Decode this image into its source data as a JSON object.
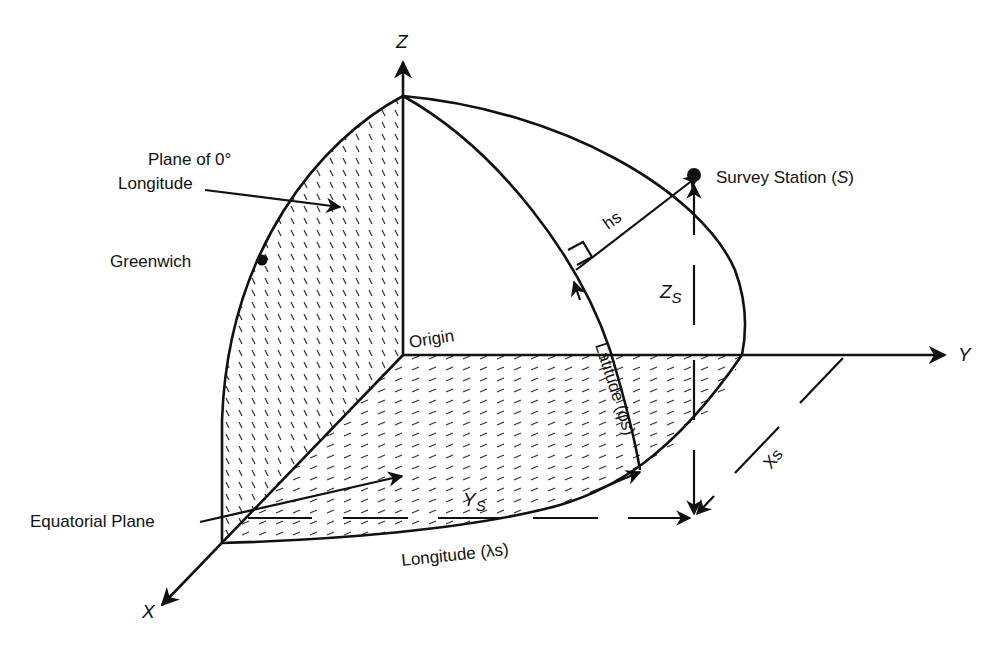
{
  "diagram": {
    "axes": {
      "z_label": "Z",
      "y_label": "Y",
      "x_label": "X"
    },
    "labels": {
      "plane_zero_line1": "Plane of 0°",
      "plane_zero_line2": "Longitude",
      "greenwich": "Greenwich",
      "origin": "Origin",
      "equatorial_plane": "Equatorial Plane",
      "survey_station": "Survey Station (",
      "survey_station_sym": "S",
      "survey_station_close": ")",
      "hs": "hs",
      "zs_main": "Z",
      "zs_sub": "S",
      "ys_main": "Y",
      "ys_sub": "S",
      "xs": "Xs",
      "latitude": "Latitude (φs)",
      "longitude": "Longitude (λs)"
    },
    "colors": {
      "ink": "#111111",
      "hatch": "#333333",
      "background": "#ffffff"
    }
  }
}
